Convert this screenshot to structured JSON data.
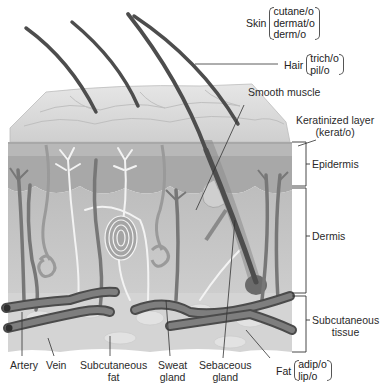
{
  "figure": {
    "colors": {
      "background": "#ffffff",
      "skin_surface": "#d9d9d9",
      "epidermis": "#a9a9a9",
      "dermis": "#c4c4c4",
      "subcutaneous": "#d6d6d6",
      "vessel": "#6e6e6e",
      "hair": "#4a4a4a",
      "nerve": "#efefef",
      "leader_line": "#333333"
    }
  },
  "labels": {
    "skin": {
      "name": "Skin",
      "roots": [
        "cutane/o",
        "dermat/o",
        "derm/o"
      ]
    },
    "hair": {
      "name": "Hair",
      "roots": [
        "trich/o",
        "pil/o"
      ]
    },
    "smooth_muscle": "Smooth muscle",
    "keratinized_layer": {
      "line1": "Keratinized layer",
      "line2": "(kerat/o)"
    },
    "epidermis": "Epidermis",
    "dermis": "Dermis",
    "subcutaneous_tissue": {
      "line1": "Subcutaneous",
      "line2": "tissue"
    },
    "artery": "Artery",
    "vein": "Vein",
    "subcutaneous_fat": {
      "line1": "Subcutaneous",
      "line2": "fat"
    },
    "sweat_gland": {
      "line1": "Sweat",
      "line2": "gland"
    },
    "sebaceous_gland": {
      "line1": "Sebaceous",
      "line2": "gland"
    },
    "fat": {
      "name": "Fat",
      "roots": [
        "adip/o",
        "lip/o"
      ]
    }
  }
}
